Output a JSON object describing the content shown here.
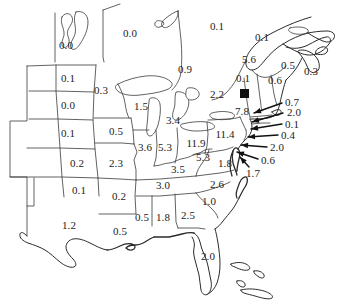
{
  "figure": {
    "name": "us-deposition-map",
    "marker_name": "monitoring-site-marker",
    "marker_x": 240,
    "marker_y": 89,
    "marker_size": 9
  },
  "chart_data": {
    "type": "map",
    "title": "",
    "subtitle": "",
    "xlabel": "",
    "ylabel": "",
    "grid": false,
    "legend": "none",
    "units": "",
    "regions": [
      {
        "label": "0.0",
        "x": 66,
        "y": 45
      },
      {
        "label": "0.0",
        "x": 130,
        "y": 33
      },
      {
        "label": "0.1",
        "x": 217,
        "y": 26
      },
      {
        "label": "0.1",
        "x": 262,
        "y": 37
      },
      {
        "label": "0.1",
        "x": 68,
        "y": 78
      },
      {
        "label": "0.3",
        "x": 101,
        "y": 90
      },
      {
        "label": "0.9",
        "x": 185,
        "y": 69
      },
      {
        "label": "5.6",
        "x": 249,
        "y": 59
      },
      {
        "label": "0.5",
        "x": 288,
        "y": 65
      },
      {
        "label": "0.3",
        "x": 311,
        "y": 71
      },
      {
        "label": "0.0",
        "x": 68,
        "y": 105
      },
      {
        "label": "1.5",
        "x": 141,
        "y": 106
      },
      {
        "label": "2.2",
        "x": 217,
        "y": 94
      },
      {
        "label": "0.1",
        "x": 243,
        "y": 78
      },
      {
        "label": "0.6",
        "x": 275,
        "y": 80
      },
      {
        "label": "7.8",
        "x": 242,
        "y": 111
      },
      {
        "label": "0.1",
        "x": 68,
        "y": 133
      },
      {
        "label": "0.5",
        "x": 116,
        "y": 131
      },
      {
        "label": "3.4",
        "x": 173,
        "y": 120
      },
      {
        "label": "11.4",
        "x": 225,
        "y": 134
      },
      {
        "label": "3.6",
        "x": 145,
        "y": 147
      },
      {
        "label": "5.3",
        "x": 165,
        "y": 147
      },
      {
        "label": "11.9",
        "x": 196,
        "y": 143
      },
      {
        "label": "0.2",
        "x": 77,
        "y": 163
      },
      {
        "label": "2.3",
        "x": 116,
        "y": 163
      },
      {
        "label": "3.5",
        "x": 178,
        "y": 169
      },
      {
        "label": "5.3",
        "x": 203,
        "y": 157
      },
      {
        "label": "1.8",
        "x": 225,
        "y": 163
      },
      {
        "label": "0.1",
        "x": 79,
        "y": 190
      },
      {
        "label": "0.2",
        "x": 119,
        "y": 196
      },
      {
        "label": "3.0",
        "x": 163,
        "y": 185
      },
      {
        "label": "2.6",
        "x": 217,
        "y": 184
      },
      {
        "label": "1.0",
        "x": 209,
        "y": 201
      },
      {
        "label": "1.2",
        "x": 69,
        "y": 225
      },
      {
        "label": "0.5",
        "x": 120,
        "y": 231
      },
      {
        "label": "0.5",
        "x": 142,
        "y": 217
      },
      {
        "label": "1.8",
        "x": 163,
        "y": 217
      },
      {
        "label": "2.5",
        "x": 188,
        "y": 215
      },
      {
        "label": "2.0",
        "x": 208,
        "y": 256
      }
    ],
    "callouts": [
      {
        "label": "0.7",
        "x": 292,
        "y": 102,
        "line": [
          [
            282,
            103
          ],
          [
            254,
            113
          ]
        ]
      },
      {
        "label": "2.0",
        "x": 294,
        "y": 112,
        "line": [
          [
            283,
            113
          ],
          [
            252,
            122
          ]
        ]
      },
      {
        "label": "0.1",
        "x": 292,
        "y": 124,
        "line": [
          [
            282,
            124
          ],
          [
            251,
            129
          ]
        ]
      },
      {
        "label": "0.4",
        "x": 288,
        "y": 135,
        "line": [
          [
            278,
            135
          ],
          [
            248,
            137
          ]
        ]
      },
      {
        "label": "2.0",
        "x": 277,
        "y": 147,
        "line": [
          [
            267,
            147
          ],
          [
            241,
            145
          ]
        ]
      },
      {
        "label": "0.6",
        "x": 268,
        "y": 160,
        "line": [
          [
            258,
            159
          ],
          [
            237,
            152
          ]
        ]
      },
      {
        "label": "1.7",
        "x": 253,
        "y": 173,
        "line": [
          [
            249,
            167
          ],
          [
            240,
            157
          ]
        ]
      }
    ]
  }
}
